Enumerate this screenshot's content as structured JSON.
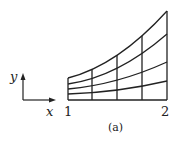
{
  "figure": {
    "caption": "(a)",
    "axes_glyph": {
      "x_label": "x",
      "y_label": "y"
    },
    "ticks": {
      "left": "1",
      "right": "2"
    }
  },
  "grid": {
    "vertical_lines_x": [
      68,
      92,
      117,
      142,
      167
    ],
    "baseline_y": 100,
    "curves": [
      {
        "name": "top",
        "left_y": 78,
        "mid_y": 55,
        "right_y": 11
      },
      {
        "name": "curve-3",
        "left_y": 84,
        "mid_y": 68,
        "right_y": 34
      },
      {
        "name": "curve-2",
        "left_y": 89,
        "mid_y": 80,
        "right_y": 62
      },
      {
        "name": "curve-1",
        "left_y": 94,
        "mid_y": 90,
        "right_y": 81
      },
      {
        "name": "bottom",
        "left_y": 100,
        "mid_y": 100,
        "right_y": 100
      }
    ]
  },
  "colors": {
    "stroke": "#222222",
    "background": "#ffffff"
  }
}
